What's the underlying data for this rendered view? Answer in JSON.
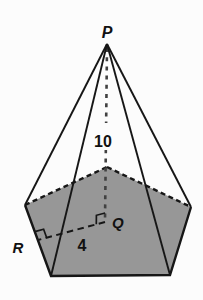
{
  "figure": {
    "type": "pentagonal-pyramid-diagram",
    "labels": {
      "apex": "P",
      "height": "10",
      "center": "Q",
      "apothem_length": "4",
      "edge_point": "R"
    },
    "colors": {
      "background": "#fcfcfc",
      "base_fill": "#979797",
      "line": "#161616",
      "altitude_line": "#414141",
      "label_text": "#111111"
    }
  }
}
